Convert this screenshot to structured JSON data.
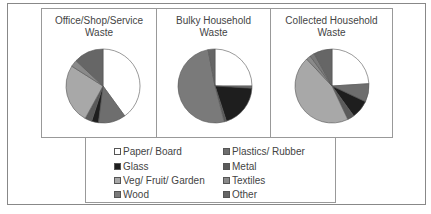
{
  "chart_data": [
    {
      "type": "pie",
      "title": "Office/Shop/Service Waste",
      "categories": [
        "Paper/ Board",
        "Plastics/ Rubber",
        "Glass",
        "Metal",
        "Veg/ Fruit/ Garden",
        "Textiles",
        "Wood",
        "Other"
      ],
      "values": [
        40,
        12,
        3,
        3,
        26,
        3,
        0,
        13
      ]
    },
    {
      "type": "pie",
      "title": "Bulky Household Waste",
      "categories": [
        "Paper/ Board",
        "Plastics/ Rubber",
        "Glass",
        "Metal",
        "Veg/ Fruit/ Garden",
        "Textiles",
        "Wood",
        "Other"
      ],
      "values": [
        25,
        1,
        19,
        1,
        0,
        0,
        51,
        3
      ]
    },
    {
      "type": "pie",
      "title": "Collected Household Waste",
      "categories": [
        "Paper/ Board",
        "Plastics/ Rubber",
        "Glass",
        "Metal",
        "Veg/ Fruit/ Garden",
        "Textiles",
        "Wood",
        "Other"
      ],
      "values": [
        24,
        8,
        8,
        3,
        45,
        2,
        2,
        8
      ]
    }
  ],
  "panels": [
    {
      "title_line1": "Office/Shop/Service",
      "title_line2": "Waste"
    },
    {
      "title_line1": "Bulky Household",
      "title_line2": "Waste"
    },
    {
      "title_line1": "Collected Household",
      "title_line2": "Waste"
    }
  ],
  "legend": {
    "items": [
      {
        "label": "Paper/ Board",
        "color": "#ffffff"
      },
      {
        "label": "Plastics/ Rubber",
        "color": "#6e6e6e"
      },
      {
        "label": "Glass",
        "color": "#1e1e1e"
      },
      {
        "label": "Metal",
        "color": "#5a5a5a"
      },
      {
        "label": "Veg/ Fruit/ Garden",
        "color": "#a8a8a8"
      },
      {
        "label": "Textiles",
        "color": "#8a8a8a"
      },
      {
        "label": "Wood",
        "color": "#7a7a7a"
      },
      {
        "label": "Other",
        "color": "#666666"
      }
    ]
  }
}
